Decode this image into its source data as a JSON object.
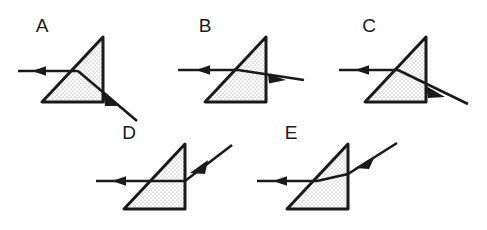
{
  "figure": {
    "background_color": "#ffffff",
    "ink_color": "#1a1a1a",
    "prism_fill": "dotted-stipple",
    "prism_fill_base_color": "#ffffff",
    "prism_dot_color": "#8c8c8c",
    "width": 487,
    "height": 230,
    "rows": 2,
    "row_1_count": 3,
    "row_2_count": 2
  },
  "panels": [
    {
      "id": "A",
      "label": "A",
      "row": 1,
      "prism_shape": "right-triangle",
      "right_angle_corner": "bottom-right",
      "incoming_ray": "horizontal-from-left",
      "incoming_arrow": "solid-triangle-midline",
      "exit_ray": "steep-downward-right",
      "exit_arrow": "solid-triangle",
      "internal_ray": "slight-downward",
      "description": "Ray enters the hypotenuse, bends slightly downward inside the prism, and exits the vertical face steeply downward."
    },
    {
      "id": "B",
      "label": "B",
      "row": 1,
      "prism_shape": "right-triangle",
      "right_angle_corner": "bottom-right",
      "incoming_ray": "horizontal-from-left",
      "incoming_arrow": "solid-triangle-midline",
      "exit_ray": "nearly-horizontal-slight-downward",
      "exit_arrow": "solid-triangle",
      "internal_ray": "horizontal",
      "description": "Ray passes essentially straight through the prism, exiting nearly horizontally with a very slight downward tilt."
    },
    {
      "id": "C",
      "label": "C",
      "row": 1,
      "prism_shape": "right-triangle",
      "right_angle_corner": "bottom-right",
      "incoming_ray": "horizontal-from-left",
      "incoming_arrow": "solid-triangle-midline",
      "exit_ray": "shallow-downward-right",
      "exit_arrow": "solid-triangle",
      "internal_ray": "downward",
      "description": "Ray bends downward inside the prism and exits the vertical face at a shallow downward angle."
    },
    {
      "id": "D",
      "label": "D",
      "row": 2,
      "prism_shape": "right-triangle",
      "right_angle_corner": "bottom-right",
      "incoming_ray": "horizontal-from-left",
      "incoming_arrow": "solid-triangle-midline",
      "exit_ray": "upward-right",
      "exit_arrow": "solid-triangle",
      "internal_ray": "horizontal",
      "description": "Ray travels horizontally through the prism and exits the vertical face angled upward."
    },
    {
      "id": "E",
      "label": "E",
      "row": 2,
      "prism_shape": "right-triangle",
      "right_angle_corner": "bottom-right",
      "incoming_ray": "horizontal-from-left",
      "incoming_arrow": "solid-triangle-midline",
      "exit_ray": "steeper-upward-right",
      "exit_arrow": "solid-triangle",
      "internal_ray": "slight-upward",
      "description": "Ray bends upward inside the prism and exits the vertical face at a steeper upward angle."
    }
  ]
}
